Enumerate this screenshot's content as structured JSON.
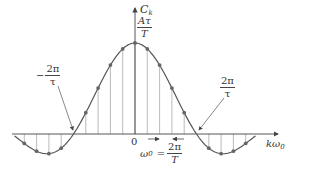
{
  "figure": {
    "y_axis_label_main": "C",
    "y_axis_label_sub": "k",
    "x_axis_label_main": "kω",
    "x_axis_label_sub": "0",
    "peak_label": {
      "numerator": "Aτ",
      "denominator": "T"
    },
    "origin_label": "0",
    "left_zero_label": {
      "sign": "−",
      "numerator": "2π",
      "denominator": "τ"
    },
    "right_zero_label": {
      "numerator": "2π",
      "denominator": "τ"
    },
    "spacing_label": {
      "lhs_main": "ω",
      "lhs_sub": "0",
      "equals": "=",
      "numerator": "2π",
      "denominator": "T"
    },
    "colors": {
      "curve": "#555555",
      "axis": "#444444",
      "stem": "#aaaaaa",
      "dot": "#666666"
    }
  },
  "chart_data": {
    "type": "scatter",
    "title": "",
    "xlabel": "kω0",
    "ylabel": "C_k",
    "x": [
      -10,
      -9,
      -8,
      -7,
      -6,
      -5,
      -4,
      -3,
      -2,
      -1,
      0,
      1,
      2,
      3,
      4,
      5,
      6,
      7,
      8,
      9,
      10
    ],
    "series": [
      {
        "name": "C_k (normalized to Aτ/T)",
        "values": [
          0.0,
          -0.104,
          -0.189,
          -0.216,
          -0.156,
          0.0,
          0.234,
          0.505,
          0.757,
          0.935,
          1.0,
          0.935,
          0.757,
          0.505,
          0.234,
          0.0,
          -0.156,
          -0.216,
          -0.189,
          -0.104,
          0.0
        ]
      }
    ],
    "annotations": [
      "Aτ/T",
      "−2π/τ",
      "2π/τ",
      "ω0 = 2π/T",
      "0"
    ],
    "ylim": [
      -0.25,
      1.0
    ],
    "grid": false
  }
}
